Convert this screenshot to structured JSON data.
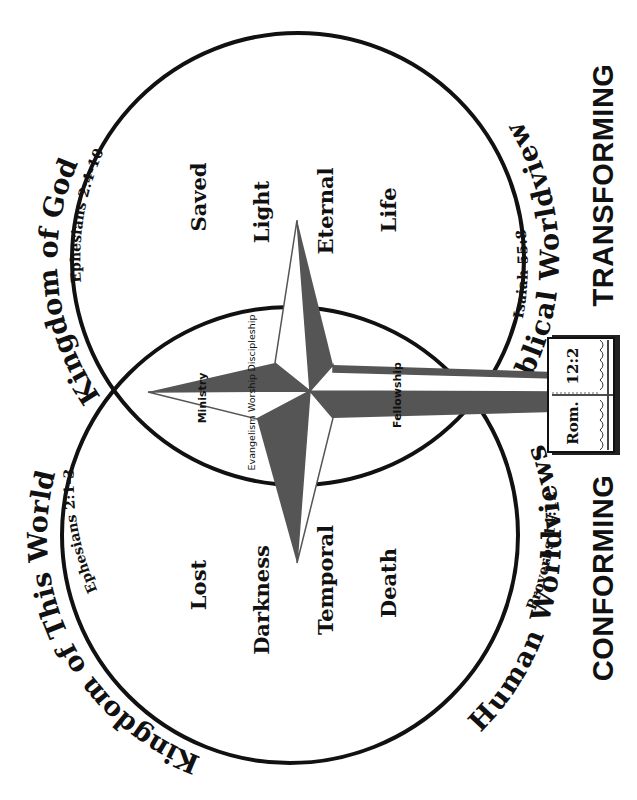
{
  "diagram": {
    "orientation": "rotated-90-ccw",
    "colors": {
      "ink": "#111111",
      "star_dark": "#555555",
      "background": "#ffffff"
    },
    "circles": {
      "kingdom_of_god": {
        "title": "Kingdom of God",
        "reference": "Ephesians 2:4-10",
        "worldview": "Biblical Worldview",
        "worldview_reference": "Isaiah 55:8",
        "words": [
          "Saved",
          "Light",
          "Eternal",
          "Life"
        ]
      },
      "kingdom_of_this_world": {
        "title": "Kingdom of This World",
        "reference": "Ephesians 2:1-3",
        "worldview": "Human Worldviews",
        "worldview_reference": "Proverbs 14:12",
        "words": [
          "Lost",
          "Darkness",
          "Temporal",
          "Death"
        ]
      }
    },
    "cross": {
      "facets": [
        "Ministry",
        "Evangelism",
        "Worship",
        "Discipleship",
        "Fellowship"
      ]
    },
    "book": {
      "label_left": "Rom.",
      "label_right": "12:2",
      "icon": "open-bible-icon"
    },
    "labels": {
      "conforming": "CONFORMING",
      "transforming": "TRANSFORMING"
    }
  }
}
